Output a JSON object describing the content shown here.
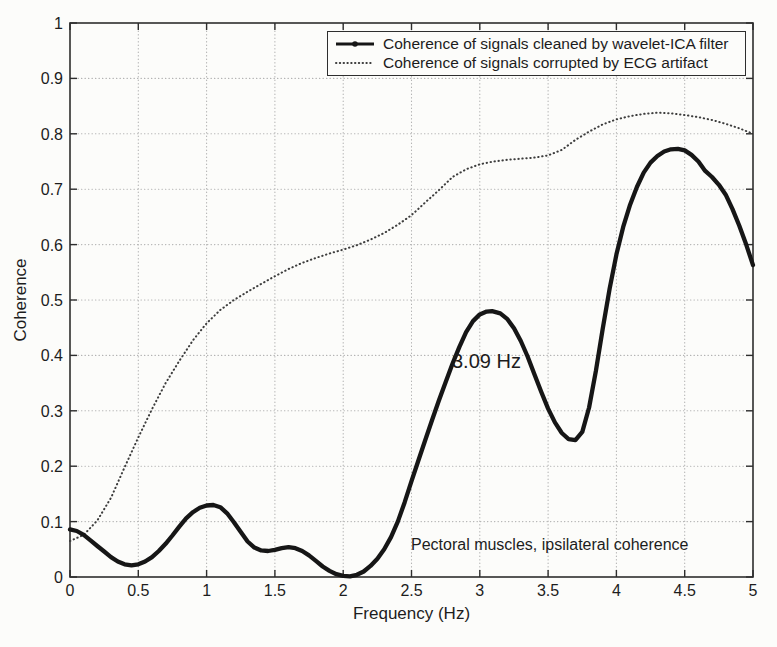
{
  "chart_data": {
    "type": "line",
    "title": "",
    "xlabel": "Frequency (Hz)",
    "ylabel": "Coherence",
    "xlim": [
      0,
      5
    ],
    "ylim": [
      0,
      1
    ],
    "x_ticks": [
      "0",
      "0.5",
      "1",
      "1.5",
      "2",
      "2.5",
      "3",
      "3.5",
      "4",
      "4.5",
      "5"
    ],
    "y_ticks": [
      "0",
      "0.1",
      "0.2",
      "0.3",
      "0.4",
      "0.5",
      "0.6",
      "0.7",
      "0.8",
      "0.9",
      "1"
    ],
    "grid": true,
    "legend_position": "top-center-inside",
    "series": [
      {
        "name": "Coherence of signals cleaned by wavelet-ICA filter",
        "style": "solid-thick-dot-markers",
        "color": "#161616",
        "points": [
          [
            0,
            0.086
          ],
          [
            0.05,
            0.083
          ],
          [
            0.1,
            0.076
          ],
          [
            0.15,
            0.066
          ],
          [
            0.2,
            0.056
          ],
          [
            0.25,
            0.046
          ],
          [
            0.3,
            0.036
          ],
          [
            0.35,
            0.028
          ],
          [
            0.4,
            0.023
          ],
          [
            0.45,
            0.021
          ],
          [
            0.5,
            0.023
          ],
          [
            0.55,
            0.028
          ],
          [
            0.6,
            0.036
          ],
          [
            0.65,
            0.047
          ],
          [
            0.7,
            0.06
          ],
          [
            0.75,
            0.075
          ],
          [
            0.8,
            0.091
          ],
          [
            0.85,
            0.106
          ],
          [
            0.9,
            0.117
          ],
          [
            0.95,
            0.125
          ],
          [
            1,
            0.129
          ],
          [
            1.05,
            0.13
          ],
          [
            1.1,
            0.126
          ],
          [
            1.15,
            0.115
          ],
          [
            1.2,
            0.099
          ],
          [
            1.25,
            0.081
          ],
          [
            1.3,
            0.064
          ],
          [
            1.35,
            0.053
          ],
          [
            1.4,
            0.048
          ],
          [
            1.45,
            0.047
          ],
          [
            1.5,
            0.049
          ],
          [
            1.55,
            0.052
          ],
          [
            1.6,
            0.054
          ],
          [
            1.65,
            0.052
          ],
          [
            1.7,
            0.047
          ],
          [
            1.75,
            0.039
          ],
          [
            1.8,
            0.029
          ],
          [
            1.85,
            0.019
          ],
          [
            1.9,
            0.011
          ],
          [
            1.95,
            0.005
          ],
          [
            2,
            0.002
          ],
          [
            2.05,
            0.001
          ],
          [
            2.1,
            0.004
          ],
          [
            2.15,
            0.01
          ],
          [
            2.2,
            0.02
          ],
          [
            2.25,
            0.033
          ],
          [
            2.3,
            0.05
          ],
          [
            2.35,
            0.072
          ],
          [
            2.4,
            0.1
          ],
          [
            2.45,
            0.135
          ],
          [
            2.5,
            0.173
          ],
          [
            2.55,
            0.21
          ],
          [
            2.6,
            0.247
          ],
          [
            2.65,
            0.283
          ],
          [
            2.7,
            0.318
          ],
          [
            2.75,
            0.352
          ],
          [
            2.8,
            0.385
          ],
          [
            2.85,
            0.415
          ],
          [
            2.9,
            0.442
          ],
          [
            2.95,
            0.462
          ],
          [
            3,
            0.474
          ],
          [
            3.05,
            0.479
          ],
          [
            3.09,
            0.48
          ],
          [
            3.15,
            0.476
          ],
          [
            3.2,
            0.466
          ],
          [
            3.25,
            0.449
          ],
          [
            3.3,
            0.426
          ],
          [
            3.35,
            0.398
          ],
          [
            3.4,
            0.366
          ],
          [
            3.45,
            0.334
          ],
          [
            3.5,
            0.304
          ],
          [
            3.55,
            0.279
          ],
          [
            3.6,
            0.26
          ],
          [
            3.65,
            0.249
          ],
          [
            3.7,
            0.247
          ],
          [
            3.75,
            0.262
          ],
          [
            3.8,
            0.306
          ],
          [
            3.85,
            0.372
          ],
          [
            3.9,
            0.448
          ],
          [
            3.95,
            0.52
          ],
          [
            4,
            0.582
          ],
          [
            4.05,
            0.632
          ],
          [
            4.1,
            0.672
          ],
          [
            4.15,
            0.704
          ],
          [
            4.2,
            0.73
          ],
          [
            4.25,
            0.748
          ],
          [
            4.3,
            0.76
          ],
          [
            4.35,
            0.768
          ],
          [
            4.4,
            0.772
          ],
          [
            4.45,
            0.773
          ],
          [
            4.5,
            0.77
          ],
          [
            4.55,
            0.762
          ],
          [
            4.6,
            0.75
          ],
          [
            4.65,
            0.733
          ],
          [
            4.7,
            0.722
          ],
          [
            4.75,
            0.708
          ],
          [
            4.8,
            0.69
          ],
          [
            4.85,
            0.664
          ],
          [
            4.9,
            0.634
          ],
          [
            4.95,
            0.6
          ],
          [
            5,
            0.563
          ]
        ]
      },
      {
        "name": "Coherence of signals corrupted by ECG artifact",
        "style": "dotted",
        "color": "#3d3d3d",
        "points": [
          [
            0,
            0.065
          ],
          [
            0.1,
            0.076
          ],
          [
            0.2,
            0.102
          ],
          [
            0.3,
            0.143
          ],
          [
            0.4,
            0.198
          ],
          [
            0.5,
            0.252
          ],
          [
            0.6,
            0.303
          ],
          [
            0.7,
            0.35
          ],
          [
            0.8,
            0.39
          ],
          [
            0.9,
            0.427
          ],
          [
            1,
            0.458
          ],
          [
            1.1,
            0.482
          ],
          [
            1.2,
            0.5
          ],
          [
            1.3,
            0.515
          ],
          [
            1.4,
            0.529
          ],
          [
            1.5,
            0.543
          ],
          [
            1.6,
            0.556
          ],
          [
            1.7,
            0.567
          ],
          [
            1.8,
            0.576
          ],
          [
            1.9,
            0.584
          ],
          [
            2,
            0.591
          ],
          [
            2.1,
            0.599
          ],
          [
            2.2,
            0.609
          ],
          [
            2.3,
            0.621
          ],
          [
            2.4,
            0.636
          ],
          [
            2.5,
            0.653
          ],
          [
            2.6,
            0.676
          ],
          [
            2.7,
            0.698
          ],
          [
            2.8,
            0.722
          ],
          [
            2.9,
            0.736
          ],
          [
            3,
            0.745
          ],
          [
            3.1,
            0.75
          ],
          [
            3.2,
            0.753
          ],
          [
            3.3,
            0.755
          ],
          [
            3.4,
            0.757
          ],
          [
            3.5,
            0.761
          ],
          [
            3.6,
            0.771
          ],
          [
            3.7,
            0.789
          ],
          [
            3.8,
            0.804
          ],
          [
            3.9,
            0.817
          ],
          [
            4,
            0.826
          ],
          [
            4.1,
            0.832
          ],
          [
            4.2,
            0.836
          ],
          [
            4.3,
            0.838
          ],
          [
            4.4,
            0.837
          ],
          [
            4.5,
            0.834
          ],
          [
            4.6,
            0.83
          ],
          [
            4.7,
            0.825
          ],
          [
            4.8,
            0.818
          ],
          [
            4.9,
            0.81
          ],
          [
            5,
            0.8
          ]
        ]
      }
    ],
    "annotations": [
      {
        "text": "3.09 Hz"
      },
      {
        "text": "Pectoral muscles, ipsilateral coherence"
      }
    ],
    "colors": {
      "frame": "#2e2e2e",
      "grid": "#b3b3b3",
      "background": "#fcfcfa",
      "text": "#1d1d1d"
    }
  }
}
